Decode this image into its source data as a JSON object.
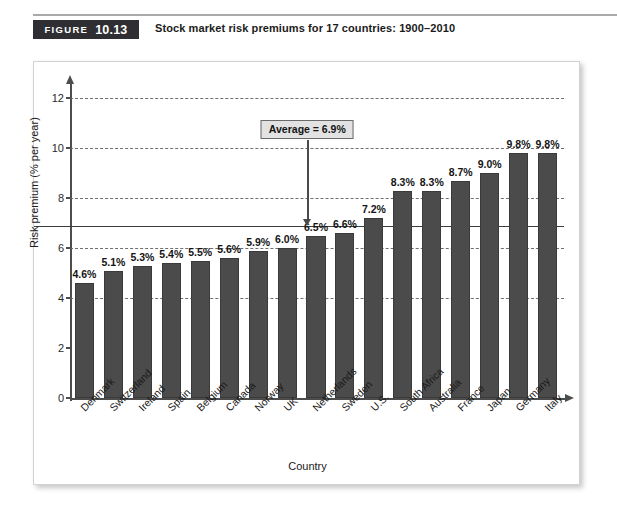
{
  "figure": {
    "badge_word": "FIGURE",
    "badge_number": "10.13",
    "caption": "Stock market risk premiums for 17 countries: 1900–2010"
  },
  "colors": {
    "bar": "#4b4b4b",
    "badge_bg": "#2f2f33",
    "grid": "#6f6f6f",
    "average_line": "#3d3d3d",
    "callout_bg": "#e2e2e2"
  },
  "annotation": {
    "average_label": "Average = 6.9%",
    "average_value": 6.9
  },
  "chart_data": {
    "type": "bar",
    "title": "Stock market risk premiums for 17 countries: 1900–2010",
    "xlabel": "Country",
    "ylabel": "Risk premium (% per year)",
    "ylim": [
      0,
      12
    ],
    "yticks": [
      0,
      2,
      4,
      6,
      8,
      10,
      12
    ],
    "ytick_labels": [
      "0",
      "2",
      "4",
      "6",
      "8",
      "10",
      "12"
    ],
    "gridlines": [
      4,
      6,
      8,
      10,
      12
    ],
    "grid": true,
    "legend": "none",
    "categories": [
      "Denmark",
      "Switzerland",
      "Ireland",
      "Spain",
      "Belgium",
      "Canada",
      "Norway",
      "UK",
      "Netherlands",
      "Sweden",
      "U.S.",
      "South Africa",
      "Australia",
      "France",
      "Japan",
      "Germany",
      "Italy"
    ],
    "values": [
      4.6,
      5.1,
      5.3,
      5.4,
      5.5,
      5.6,
      5.9,
      6.0,
      6.5,
      6.6,
      7.2,
      8.3,
      8.3,
      8.7,
      9.0,
      9.8,
      9.8
    ],
    "data_labels": [
      "4.6%",
      "5.1%",
      "5.3%",
      "5.4%",
      "5.5%",
      "5.6%",
      "5.9%",
      "6.0%",
      "6.5%",
      "6.6%",
      "7.2%",
      "8.3%",
      "8.3%",
      "8.7%",
      "9.0%",
      "9.8%",
      "9.8%"
    ],
    "annotations": [
      {
        "text": "Average = 6.9%",
        "value": 6.9
      }
    ]
  }
}
